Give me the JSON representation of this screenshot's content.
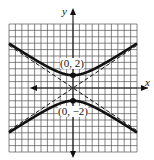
{
  "chart_data": {
    "type": "line",
    "title": "",
    "xlabel": "x",
    "ylabel": "y",
    "xlim": [
      -10,
      10
    ],
    "ylim": [
      -10,
      10
    ],
    "grid": true,
    "legend": null,
    "series": [
      {
        "name": "hyperbola upper branch",
        "style": "solid-thick",
        "equation": "y = 2*sqrt(1 + x^2/9)"
      },
      {
        "name": "hyperbola lower branch",
        "style": "solid-thick",
        "equation": "y = -2*sqrt(1 + x^2/9)"
      },
      {
        "name": "asymptote 1",
        "style": "dashed",
        "equation": "y = (2/3)x"
      },
      {
        "name": "asymptote 2",
        "style": "dashed",
        "equation": "y = -(2/3)x"
      }
    ],
    "points": [
      {
        "x": 0,
        "y": 2,
        "label": "(0, 2)"
      },
      {
        "x": 0,
        "y": -2,
        "label": "(0, −2)"
      }
    ]
  },
  "labels": {
    "x_axis": "x",
    "y_axis": "y",
    "vertex_top": "(0, 2)",
    "vertex_bottom": "(0, −2)"
  },
  "colors": {
    "grid": "#3a3a3a",
    "curve": "#111111",
    "background": "#ffffff"
  }
}
